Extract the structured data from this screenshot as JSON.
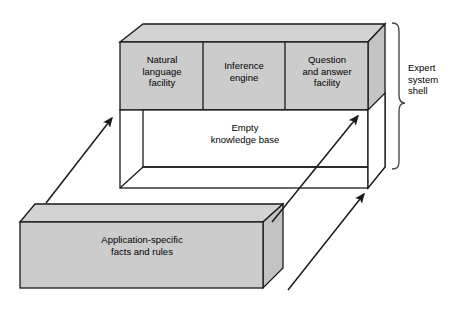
{
  "diagram": {
    "colors": {
      "box_fill": "#c9c9c9",
      "box_fill_light": "#d4d4d4",
      "empty_fill": "#ffffff",
      "stroke": "#1a1a1a",
      "background": "#ffffff",
      "text": "#000000"
    },
    "shell": {
      "bracket_label": "Expert\nsystem\nshell",
      "panels": [
        {
          "id": "natural-language-facility",
          "label": "Natural\nlanguage\nfacility"
        },
        {
          "id": "inference-engine",
          "label": "Inference\nengine"
        },
        {
          "id": "question-answer-facility",
          "label": "Question\nand answer\nfacility"
        }
      ],
      "knowledge_base": {
        "id": "empty-knowledge-base",
        "label": "Empty\nknowledge base"
      }
    },
    "application_block": {
      "id": "application-specific-facts-and-rules",
      "label": "Application-specific\nfacts and rules"
    },
    "arrows": [
      {
        "id": "arrow-left-to-knowledge-base",
        "from": "application_block",
        "to": "knowledge_base_left"
      },
      {
        "id": "arrow-middle-to-knowledge-base",
        "from": "application_block",
        "to": "knowledge_base_right"
      },
      {
        "id": "arrow-right-to-shell-base",
        "from": "application_block",
        "to": "shell_bottom_right"
      }
    ]
  }
}
